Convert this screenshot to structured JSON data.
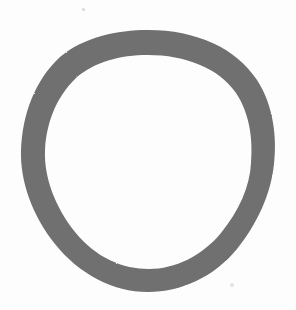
{
  "canvas": {
    "width": 296,
    "height": 310,
    "background_color": "#fdfdfd",
    "description": "Hand-drawn closed loop stroke on plain near-white paper"
  },
  "ink": {
    "stroke_color": "#706f70",
    "stroke_color_light": "#8a8a8a",
    "stroke_width_px": 24,
    "glyph_name": "hand-drawn-ring",
    "glyph_reading": "O",
    "bounds": {
      "left": 20,
      "top": 30,
      "right": 275,
      "bottom": 292
    },
    "outer_path": "M 148 30 C 196 30 236 48 257 80 C 274 106 277 139 274 164 C 271 194 257 224 237 249 C 214 277 181 292 148 292 C 113 292 79 274 55 244 C 32 215 20 181 21 150 C 22 115 35 80 60 57 C 84 37 117 30 148 30 Z",
    "inner_path": "M 148 55 C 120 55 94 62 76 78 C 56 97 46 124 45 151 C 44 177 55 207 75 232 C 96 258 123 269 149 269 C 175 269 202 256 221 233 C 239 211 250 186 251 163 C 253 140 250 114 236 93 C 219 68 185 55 148 55 Z"
  },
  "artifacts": [
    {
      "name": "speck-top",
      "x": 82,
      "y": 8,
      "size": 3,
      "color": "#d8d8d8"
    },
    {
      "name": "speck-bottom",
      "x": 230,
      "y": 283,
      "size": 4,
      "color": "#e2e2e2"
    }
  ]
}
